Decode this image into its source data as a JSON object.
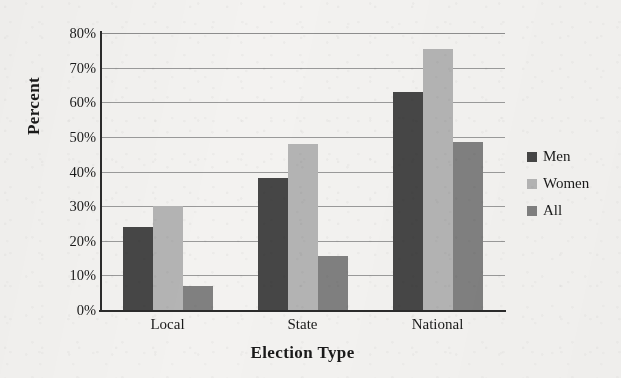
{
  "chart_data": {
    "type": "bar",
    "title": "",
    "xlabel": "Election Type",
    "ylabel": "Percent",
    "categories": [
      "Local",
      "State",
      "National"
    ],
    "series": [
      {
        "name": "Men",
        "color": "#464646",
        "values": [
          24,
          38,
          63
        ]
      },
      {
        "name": "Women",
        "color": "#b4b4b4",
        "values": [
          30,
          48,
          75.5
        ]
      },
      {
        "name": "All",
        "color": "#808080",
        "values": [
          7,
          15.5,
          48.5
        ]
      }
    ],
    "ylim": [
      0,
      80
    ],
    "ytick_step": 10,
    "ytick_labels": [
      "0%",
      "10%",
      "20%",
      "30%",
      "40%",
      "50%",
      "60%",
      "70%",
      "80%"
    ],
    "ytick_values": [
      0,
      10,
      20,
      30,
      40,
      50,
      60,
      70,
      80
    ],
    "grid": true,
    "legend_position": "right",
    "value_format": "percent"
  },
  "colors": {
    "background": "#f3f2f0",
    "axis": "#2b2b2b",
    "gridline": "#9a9a9a",
    "text": "#1a1a1a"
  }
}
